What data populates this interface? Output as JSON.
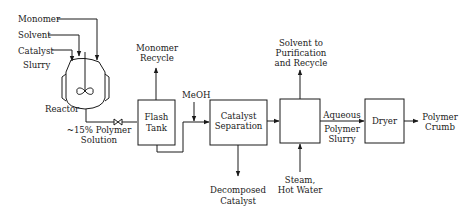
{
  "diagram": {
    "type": "process-flow",
    "inputs": {
      "monomer": "Monomer",
      "solvent": "Solvent",
      "catalyst_line1": "Catalyst",
      "catalyst_line2": "Slurry"
    },
    "units": {
      "reactor": "Reactor",
      "flash_tank_line1": "Flash",
      "flash_tank_line2": "Tank",
      "catalyst_sep_line1": "Catalyst",
      "catalyst_sep_line2": "Separation",
      "dryer": "Dryer"
    },
    "streams": {
      "polymer_solution_line1": "~15% Polymer",
      "polymer_solution_line2": "Solution",
      "monomer_recycle_line1": "Monomer",
      "monomer_recycle_line2": "Recycle",
      "meoh": "MeOH",
      "decomposed_line1": "Decomposed",
      "decomposed_line2": "Catalyst",
      "solvent_out_line1": "Solvent to",
      "solvent_out_line2": "Purification",
      "solvent_out_line3": "and Recycle",
      "steam_line1": "Steam,",
      "steam_line2": "Hot Water",
      "slurry_line1": "Aqueous",
      "slurry_line2": "Polymer",
      "slurry_line3": "Slurry",
      "product_line1": "Polymer",
      "product_line2": "Crumb"
    }
  }
}
